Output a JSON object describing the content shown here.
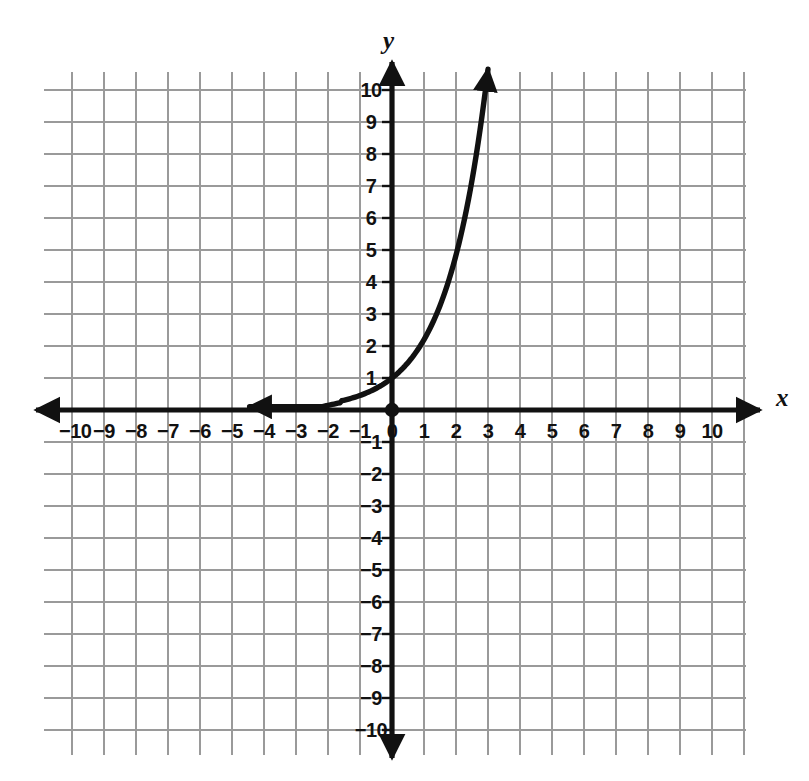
{
  "chart_data": {
    "type": "line",
    "title": "",
    "subtitle": "",
    "xlabel": "x",
    "ylabel": "y",
    "xlim": [
      -11,
      11
    ],
    "ylim": [
      -11,
      11
    ],
    "grid": true,
    "grid_step": 1,
    "legend": "none",
    "annotations": [
      "origin point marked with solid dot",
      "curve has arrowhead at left end near x = -4.4 approaching y = 0 asymptotically",
      "curve has arrowhead at upper right end near x = 3, y = 10.5"
    ],
    "x_tick_labels": [
      "-10",
      "-9",
      "-8",
      "-7",
      "-6",
      "-5",
      "-4",
      "-3",
      "-2",
      "-1",
      "0",
      "1",
      "2",
      "3",
      "4",
      "5",
      "6",
      "7",
      "8",
      "9",
      "10"
    ],
    "y_tick_labels": [
      "10",
      "9",
      "8",
      "7",
      "6",
      "5",
      "4",
      "3",
      "2",
      "1",
      "-1",
      "-2",
      "-3",
      "-4",
      "-5",
      "-6",
      "-7",
      "-8",
      "-9",
      "-10"
    ],
    "series": [
      {
        "name": "exponential-curve",
        "function": "y = 2.2^x",
        "color": "#111111",
        "x": [
          -4.45,
          -4.0,
          -3.5,
          -3.0,
          -2.5,
          -2.0,
          -1.5,
          -1.0,
          -0.5,
          0.0,
          0.5,
          1.0,
          1.5,
          2.0,
          2.5,
          3.0
        ],
        "y": [
          0.05,
          0.06,
          0.1,
          0.14,
          0.21,
          0.21,
          0.31,
          0.45,
          0.67,
          1.0,
          1.48,
          2.2,
          3.26,
          4.84,
          7.18,
          10.65
        ]
      }
    ]
  },
  "axes": {
    "x_label": "x",
    "y_label": "y",
    "origin_label": "0"
  },
  "x_ticks": [
    {
      "value": -10,
      "label": "-10"
    },
    {
      "value": -9,
      "label": "-9"
    },
    {
      "value": -8,
      "label": "-8"
    },
    {
      "value": -7,
      "label": "-7"
    },
    {
      "value": -6,
      "label": "-6"
    },
    {
      "value": -5,
      "label": "-5"
    },
    {
      "value": -4,
      "label": "-4"
    },
    {
      "value": -3,
      "label": "-3"
    },
    {
      "value": -2,
      "label": "-2"
    },
    {
      "value": -1,
      "label": "-1"
    },
    {
      "value": 0,
      "label": "0"
    },
    {
      "value": 1,
      "label": "1"
    },
    {
      "value": 2,
      "label": "2"
    },
    {
      "value": 3,
      "label": "3"
    },
    {
      "value": 4,
      "label": "4"
    },
    {
      "value": 5,
      "label": "5"
    },
    {
      "value": 6,
      "label": "6"
    },
    {
      "value": 7,
      "label": "7"
    },
    {
      "value": 8,
      "label": "8"
    },
    {
      "value": 9,
      "label": "9"
    },
    {
      "value": 10,
      "label": "10"
    }
  ],
  "y_ticks": [
    {
      "value": 10,
      "label": "10"
    },
    {
      "value": 9,
      "label": "9"
    },
    {
      "value": 8,
      "label": "8"
    },
    {
      "value": 7,
      "label": "7"
    },
    {
      "value": 6,
      "label": "6"
    },
    {
      "value": 5,
      "label": "5"
    },
    {
      "value": 4,
      "label": "4"
    },
    {
      "value": 3,
      "label": "3"
    },
    {
      "value": 2,
      "label": "2"
    },
    {
      "value": 1,
      "label": "1"
    },
    {
      "value": -1,
      "label": "-1"
    },
    {
      "value": -2,
      "label": "-2"
    },
    {
      "value": -3,
      "label": "-3"
    },
    {
      "value": -4,
      "label": "-4"
    },
    {
      "value": -5,
      "label": "-5"
    },
    {
      "value": -6,
      "label": "-6"
    },
    {
      "value": -7,
      "label": "-7"
    },
    {
      "value": -8,
      "label": "-8"
    },
    {
      "value": -9,
      "label": "-9"
    },
    {
      "value": -10,
      "label": "-10"
    }
  ],
  "colors": {
    "grid": "#9a9a9a",
    "axis": "#111111",
    "curve": "#111111",
    "background": "#ffffff"
  }
}
